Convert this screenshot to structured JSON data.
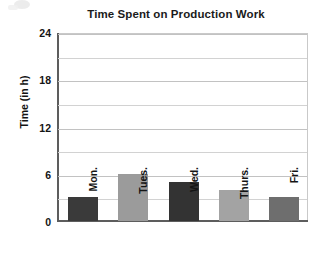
{
  "chart_data": {
    "type": "bar",
    "title": "Time Spent on Production Work",
    "xlabel": "",
    "ylabel": "Time (in h)",
    "categories": [
      "Mon.",
      "Tues.",
      "Wed.",
      "Thurs.",
      "Fri."
    ],
    "values": [
      3,
      6,
      5,
      4,
      3
    ],
    "ylim": [
      0,
      24
    ],
    "yticks": [
      0,
      6,
      12,
      18,
      24
    ],
    "ytick_labels": [
      "0",
      "6",
      "12",
      "18",
      "24"
    ],
    "minor_gridlines": [
      3,
      9,
      15,
      21
    ],
    "grid": true,
    "legend": "none",
    "bar_colors": [
      "#3a3a3a",
      "#9b9b9b",
      "#333333",
      "#a3a3a3",
      "#6e6e6e"
    ],
    "series": [
      {
        "name": "Time (in h)",
        "points": [
          {
            "category": "Mon.",
            "value": 3,
            "color": "#3a3a3a"
          },
          {
            "category": "Tues.",
            "value": 6,
            "color": "#9b9b9b"
          },
          {
            "category": "Wed.",
            "value": 5,
            "color": "#333333"
          },
          {
            "category": "Thurs.",
            "value": 4,
            "color": "#a3a3a3"
          },
          {
            "category": "Fri.",
            "value": 3,
            "color": "#6e6e6e"
          }
        ]
      }
    ]
  }
}
